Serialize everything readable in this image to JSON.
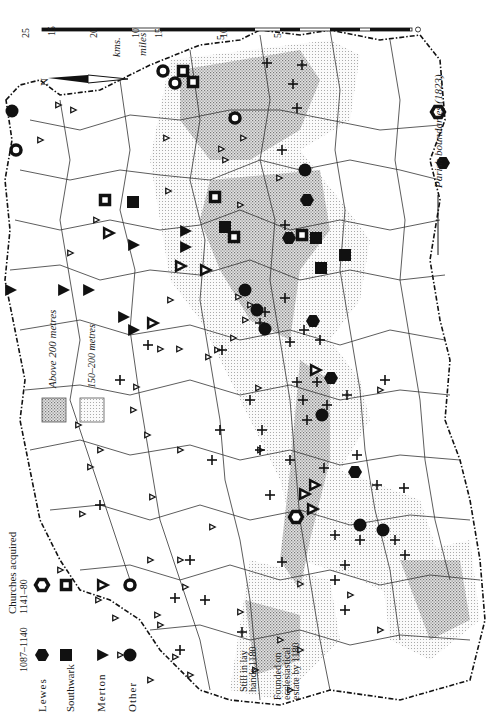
{
  "map": {
    "orientation": "rotated 90° counter-clockwise",
    "north_label": "N",
    "scale": {
      "units_top": "kms.",
      "units_bottom": "miles",
      "km_ticks": [
        "25",
        "20",
        "15",
        "10",
        "5",
        "0"
      ],
      "mile_ticks": [
        "15",
        "10",
        "5",
        "0"
      ]
    },
    "colors": {
      "ink": "#111111",
      "above_200": "#c9c9c9",
      "between_150_200": "#e6e6e6",
      "paper": "#ffffff"
    }
  },
  "legend": {
    "title": "Churches acquired",
    "period_a": "1087–1140",
    "period_b": "1141–80",
    "rows": [
      {
        "label": "Lewes",
        "symbol_a": "filled-hexagon",
        "symbol_b": "hollow-hexagon"
      },
      {
        "label": "Southwark",
        "symbol_a": "filled-square",
        "symbol_b": "hollow-square"
      },
      {
        "label": "Merton",
        "symbol_a": "filled-triangle",
        "symbol_b": "hollow-triangle"
      },
      {
        "label": "Other",
        "symbol_a": "filled-circle",
        "symbol_b": "hollow-circle"
      }
    ],
    "lay_hands": {
      "symbol": "cross",
      "label_line1": "Still in lay",
      "label_line2": "hands 1180"
    },
    "ecclesiastical": {
      "symbol": "small-hollow-triangle",
      "label_line1": "Founded on",
      "label_line2": "ecclesiastical",
      "label_line3": "estate by 1180"
    },
    "relief": [
      {
        "label": "Above 200 metres",
        "shade": "above_200"
      },
      {
        "label": "150–200 metres",
        "shade": "between_150_200"
      }
    ],
    "parish_boundaries": "Parish boundaries (1823)"
  },
  "symbols": {
    "lewes_a": [
      [
        307,
        200
      ],
      [
        443,
        163
      ],
      [
        289,
        238
      ],
      [
        313,
        321
      ],
      [
        355,
        472
      ],
      [
        331,
        378
      ]
    ],
    "lewes_b": [
      [
        438,
        112
      ],
      [
        296,
        517
      ]
    ],
    "southwark_a": [
      [
        133,
        202
      ],
      [
        225,
        227
      ],
      [
        316,
        238
      ],
      [
        321,
        268
      ],
      [
        345,
        255
      ]
    ],
    "southwark_b": [
      [
        183,
        71
      ],
      [
        193,
        82
      ],
      [
        105,
        200
      ],
      [
        215,
        197
      ],
      [
        234,
        237
      ],
      [
        302,
        235
      ]
    ],
    "merton_a": [
      [
        133,
        245
      ],
      [
        185,
        247
      ],
      [
        185,
        231
      ],
      [
        10,
        290
      ],
      [
        63,
        290
      ],
      [
        88,
        290
      ],
      [
        123,
        317
      ],
      [
        133,
        330
      ]
    ],
    "merton_b": [
      [
        108,
        233
      ],
      [
        180,
        266
      ],
      [
        152,
        323
      ],
      [
        205,
        270
      ],
      [
        315,
        370
      ],
      [
        304,
        494
      ],
      [
        314,
        485
      ],
      [
        312,
        509
      ]
    ],
    "other_a": [
      [
        245,
        290
      ],
      [
        257,
        310
      ],
      [
        265,
        329
      ],
      [
        322,
        415
      ],
      [
        360,
        525
      ],
      [
        383,
        530
      ],
      [
        305,
        170
      ],
      [
        12,
        111
      ]
    ],
    "other_b": [
      [
        163,
        71
      ],
      [
        235,
        118
      ],
      [
        175,
        83
      ],
      [
        16,
        150
      ]
    ],
    "lay": [
      [
        267,
        63
      ],
      [
        302,
        65
      ],
      [
        293,
        84
      ],
      [
        297,
        108
      ],
      [
        282,
        150
      ],
      [
        285,
        225
      ],
      [
        285,
        298
      ],
      [
        265,
        312
      ],
      [
        304,
        330
      ],
      [
        320,
        340
      ],
      [
        260,
        323
      ],
      [
        290,
        342
      ],
      [
        297,
        382
      ],
      [
        317,
        382
      ],
      [
        327,
        405
      ],
      [
        347,
        395
      ],
      [
        307,
        420
      ],
      [
        357,
        455
      ],
      [
        377,
        485
      ],
      [
        260,
        450
      ],
      [
        290,
        460
      ],
      [
        324,
        468
      ],
      [
        404,
        488
      ],
      [
        270,
        495
      ],
      [
        335,
        535
      ],
      [
        360,
        540
      ],
      [
        395,
        540
      ],
      [
        405,
        555
      ],
      [
        282,
        562
      ],
      [
        345,
        565
      ],
      [
        335,
        580
      ],
      [
        175,
        598
      ],
      [
        205,
        600
      ],
      [
        345,
        610
      ],
      [
        262,
        430
      ],
      [
        222,
        350
      ],
      [
        190,
        560
      ],
      [
        220,
        430
      ],
      [
        250,
        400
      ],
      [
        212,
        460
      ],
      [
        180,
        650
      ],
      [
        120,
        380
      ],
      [
        100,
        505
      ],
      [
        385,
        380
      ],
      [
        303,
        400
      ],
      [
        148,
        345
      ]
    ],
    "eccl": [
      [
        58,
        105
      ],
      [
        232,
        117
      ],
      [
        166,
        138
      ],
      [
        243,
        138
      ],
      [
        221,
        149
      ],
      [
        40,
        140
      ],
      [
        73,
        110
      ],
      [
        240,
        205
      ],
      [
        279,
        178
      ],
      [
        168,
        191
      ],
      [
        225,
        160
      ],
      [
        96,
        220
      ],
      [
        70,
        253
      ],
      [
        238,
        297
      ],
      [
        250,
        305
      ],
      [
        245,
        320
      ],
      [
        179,
        349
      ],
      [
        233,
        338
      ],
      [
        217,
        350
      ],
      [
        170,
        300
      ],
      [
        160,
        349
      ],
      [
        208,
        357
      ],
      [
        136,
        387
      ],
      [
        258,
        388
      ],
      [
        133,
        410
      ],
      [
        78,
        425
      ],
      [
        147,
        435
      ],
      [
        90,
        467
      ],
      [
        152,
        497
      ],
      [
        82,
        514
      ],
      [
        212,
        527
      ],
      [
        180,
        560
      ],
      [
        300,
        584
      ],
      [
        350,
        595
      ],
      [
        240,
        612
      ],
      [
        160,
        625
      ],
      [
        185,
        587
      ],
      [
        100,
        450
      ],
      [
        180,
        450
      ],
      [
        260,
        450
      ],
      [
        380,
        390
      ],
      [
        60,
        570
      ],
      [
        150,
        560
      ],
      [
        98,
        600
      ],
      [
        115,
        618
      ],
      [
        157,
        615
      ],
      [
        150,
        680
      ],
      [
        175,
        657
      ],
      [
        190,
        675
      ],
      [
        120,
        655
      ],
      [
        300,
        650
      ],
      [
        380,
        630
      ],
      [
        290,
        690
      ],
      [
        255,
        670
      ]
    ]
  }
}
